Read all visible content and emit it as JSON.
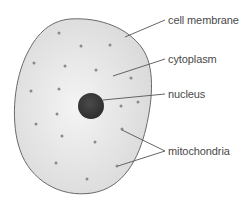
{
  "diagram": {
    "colors": {
      "background": "#ffffff",
      "cytoplasm_fill": "#d9d9d9",
      "cytoplasm_highlight": "#f4f4f4",
      "membrane_stroke": "#6a6a6a",
      "nucleus_fill": "#4a4a4a",
      "nucleus_dark": "#2e2e2e",
      "mitochondria_fill": "#8a8a8a",
      "leader_line": "#555555",
      "label_text": "#4a4a4a"
    },
    "cell": {
      "outline_path": "M 70 19 C 100 17, 128 28, 142 48 C 155 66, 153 98, 146 128 C 139 158, 124 188, 92 193 C 60 198, 30 180, 20 150 C 11 124, 13 86, 25 58 C 35 36, 48 21, 70 19 Z",
      "nucleus": {
        "cx": 91,
        "cy": 106,
        "r": 13
      },
      "mitochondria": [
        {
          "x": 59,
          "y": 33
        },
        {
          "x": 81,
          "y": 46
        },
        {
          "x": 110,
          "y": 45
        },
        {
          "x": 34,
          "y": 63
        },
        {
          "x": 65,
          "y": 66
        },
        {
          "x": 96,
          "y": 70
        },
        {
          "x": 131,
          "y": 78
        },
        {
          "x": 31,
          "y": 91
        },
        {
          "x": 59,
          "y": 89
        },
        {
          "x": 57,
          "y": 114
        },
        {
          "x": 121,
          "y": 106
        },
        {
          "x": 138,
          "y": 102
        },
        {
          "x": 36,
          "y": 124
        },
        {
          "x": 62,
          "y": 136
        },
        {
          "x": 95,
          "y": 142
        },
        {
          "x": 122,
          "y": 129
        },
        {
          "x": 56,
          "y": 163
        },
        {
          "x": 117,
          "y": 166
        },
        {
          "x": 87,
          "y": 179
        }
      ]
    },
    "labels": [
      {
        "text": "cell membrane",
        "x": 168,
        "y": 14,
        "lines": [
          {
            "x1": 125,
            "y1": 37,
            "x2": 165,
            "y2": 20
          }
        ]
      },
      {
        "text": "cytoplasm",
        "x": 168,
        "y": 53,
        "lines": [
          {
            "x1": 113,
            "y1": 76,
            "x2": 165,
            "y2": 59
          }
        ]
      },
      {
        "text": "nucleus",
        "x": 168,
        "y": 88,
        "lines": [
          {
            "x1": 103,
            "y1": 100,
            "x2": 165,
            "y2": 94
          }
        ]
      },
      {
        "text": "mitochondria",
        "x": 168,
        "y": 145,
        "lines": [
          {
            "x1": 122,
            "y1": 130,
            "x2": 165,
            "y2": 151
          },
          {
            "x1": 118,
            "y1": 166,
            "x2": 165,
            "y2": 151
          }
        ]
      }
    ]
  }
}
